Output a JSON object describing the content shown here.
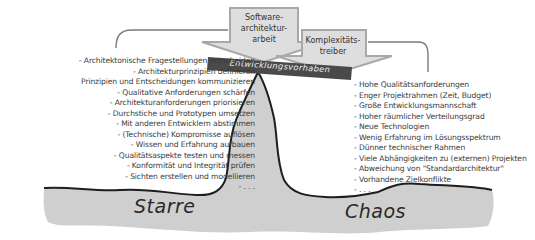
{
  "arrows": {
    "software": {
      "label": "Software-\narchitektur-\narbeit",
      "lines": [
        "Software-",
        "architektur-",
        "arbeit"
      ]
    },
    "complexity": {
      "label": "Komplexitäts-\ntreiber",
      "lines": [
        "Komplexitäts-",
        "treiber"
      ]
    }
  },
  "banner": {
    "label": "Entwicklungsvorhaben"
  },
  "left_list": {
    "items": [
      "- Architektonische Fragestellungen entscheiden",
      "- Architekturprinzipien definieren",
      "Prinzipien und Entscheidungen kommunizieren",
      "- Qualitative Anforderungen schärfen",
      "- Architekturanforderungen priorisieren",
      "- Durchstiche und Prototypen umsetzen",
      "- Mit anderen Entwicklern abstimmen",
      "- (Technische) Kompromisse auflösen",
      "- Wissen und Erfahrung aufbauen",
      "- Qualitätsaspekte testen und messen",
      "- Konformität und Integrität prüfen",
      "- Sichten erstellen und modellieren",
      "- . . ."
    ]
  },
  "right_list": {
    "items": [
      "- Hohe Qualitätsanforderungen",
      "- Enger Projektrahmen (Zeit, Budget)",
      "- Große Entwicklungsmannschaft",
      "- Hoher räumlicher Verteilungsgrad",
      "- Neue Technologien",
      "- Wenig Erfahrung im Lösungsspektrum",
      "- Dünner technischer Rahmen",
      "- Viele Abhängigkeiten zu (externen) Projekten",
      "- Abweichung von \"Standardarchitektur\"",
      "- Vorhandene Zielkonflikte",
      "- . . ."
    ]
  },
  "ground": {
    "left_label": "Starre",
    "right_label": "Chaos"
  },
  "colors": {
    "arrow_fill": "#dedede",
    "arrow_stroke": "#a8a8a8",
    "banner_fill": "#4a4a4a",
    "ground_fill": "#cfcfcf",
    "outline": "#1e1e1e"
  }
}
